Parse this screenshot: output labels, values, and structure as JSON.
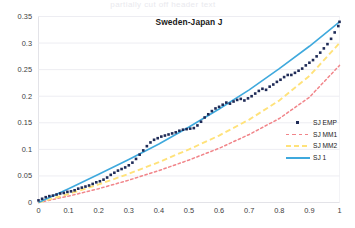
{
  "page": {
    "ghost_header": "partially cut off header text"
  },
  "chart_data": {
    "type": "scatter",
    "title": "Sweden-Japan J",
    "xlabel": "",
    "ylabel": "",
    "xlim": [
      0,
      1
    ],
    "ylim": [
      0,
      0.35
    ],
    "grid": true,
    "legend_position": "right-middle",
    "xticks": [
      "0",
      "0.1",
      "0.2",
      "0.3",
      "0.4",
      "0.5",
      "0.6",
      "0.7",
      "0.8",
      "0.9",
      "1"
    ],
    "yticks": [
      "0",
      "0.05",
      "0.1",
      "0.15",
      "0.2",
      "0.25",
      "0.3",
      "0.35"
    ],
    "colors": {
      "sj_emp": "#1f2b57",
      "sj_mm1": "#f1858a",
      "sj_mm2": "#ffe27a",
      "sj_1": "#3fa9dd",
      "gridline": "#ededf2",
      "axis": "#e3e3e8"
    },
    "series": [
      {
        "name": "SJ EMP",
        "style": "markers",
        "x": [
          0.0,
          0.012,
          0.024,
          0.036,
          0.048,
          0.06,
          0.072,
          0.084,
          0.096,
          0.108,
          0.12,
          0.132,
          0.144,
          0.156,
          0.168,
          0.18,
          0.192,
          0.204,
          0.216,
          0.228,
          0.24,
          0.252,
          0.264,
          0.276,
          0.288,
          0.3,
          0.312,
          0.324,
          0.336,
          0.348,
          0.36,
          0.372,
          0.384,
          0.396,
          0.408,
          0.42,
          0.432,
          0.444,
          0.456,
          0.468,
          0.48,
          0.492,
          0.504,
          0.516,
          0.528,
          0.54,
          0.552,
          0.564,
          0.576,
          0.588,
          0.6,
          0.612,
          0.624,
          0.636,
          0.648,
          0.66,
          0.672,
          0.684,
          0.696,
          0.708,
          0.72,
          0.732,
          0.744,
          0.756,
          0.768,
          0.78,
          0.792,
          0.804,
          0.816,
          0.828,
          0.84,
          0.852,
          0.864,
          0.876,
          0.888,
          0.9,
          0.912,
          0.924,
          0.936,
          0.948,
          0.96,
          0.972,
          0.984,
          0.996,
          1.0
        ],
        "y": [
          0.004,
          0.007,
          0.01,
          0.012,
          0.013,
          0.015,
          0.017,
          0.018,
          0.02,
          0.021,
          0.023,
          0.026,
          0.028,
          0.03,
          0.032,
          0.035,
          0.038,
          0.04,
          0.043,
          0.047,
          0.052,
          0.056,
          0.06,
          0.063,
          0.066,
          0.07,
          0.075,
          0.082,
          0.09,
          0.098,
          0.106,
          0.113,
          0.118,
          0.121,
          0.124,
          0.126,
          0.128,
          0.13,
          0.132,
          0.135,
          0.137,
          0.138,
          0.139,
          0.14,
          0.145,
          0.152,
          0.16,
          0.166,
          0.172,
          0.177,
          0.18,
          0.184,
          0.188,
          0.186,
          0.19,
          0.193,
          0.195,
          0.192,
          0.196,
          0.2,
          0.205,
          0.21,
          0.214,
          0.212,
          0.218,
          0.222,
          0.227,
          0.231,
          0.236,
          0.24,
          0.24,
          0.244,
          0.248,
          0.252,
          0.258,
          0.263,
          0.268,
          0.275,
          0.282,
          0.29,
          0.298,
          0.308,
          0.32,
          0.332,
          0.34
        ]
      },
      {
        "name": "SJ MM1",
        "style": "dotted",
        "x": [
          0,
          0.1,
          0.2,
          0.3,
          0.4,
          0.5,
          0.6,
          0.7,
          0.8,
          0.9,
          1.0
        ],
        "y": [
          0.0,
          0.012,
          0.026,
          0.042,
          0.06,
          0.08,
          0.102,
          0.128,
          0.158,
          0.198,
          0.258
        ]
      },
      {
        "name": "SJ MM2",
        "style": "dashed",
        "x": [
          0,
          0.1,
          0.2,
          0.3,
          0.4,
          0.5,
          0.6,
          0.7,
          0.8,
          0.9,
          1.0
        ],
        "y": [
          0.0,
          0.016,
          0.034,
          0.054,
          0.076,
          0.1,
          0.126,
          0.156,
          0.192,
          0.238,
          0.3
        ]
      },
      {
        "name": "SJ 1",
        "style": "solid",
        "x": [
          0,
          0.1,
          0.2,
          0.3,
          0.4,
          0.5,
          0.6,
          0.7,
          0.8,
          0.9,
          1.0
        ],
        "y": [
          0.0,
          0.026,
          0.053,
          0.081,
          0.11,
          0.142,
          0.176,
          0.212,
          0.252,
          0.294,
          0.34
        ]
      }
    ],
    "legend": [
      {
        "label": "SJ EMP",
        "key": "marker"
      },
      {
        "label": "SJ MM1",
        "key": "dotted-red"
      },
      {
        "label": "SJ MM2",
        "key": "dashed-yellow"
      },
      {
        "label": "SJ 1",
        "key": "solid-blue"
      }
    ]
  }
}
